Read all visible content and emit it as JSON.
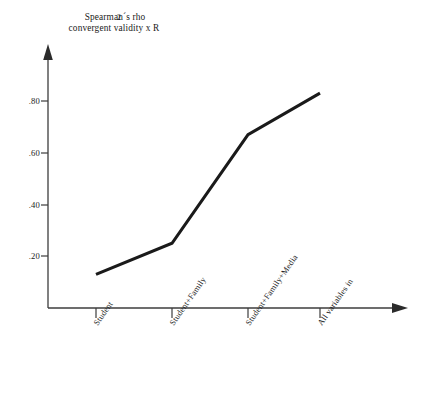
{
  "chart_data": {
    "type": "line",
    "title": "Spearman´s rho convergent validity x R",
    "title_line1": "Spearman´s rho",
    "title_line2": "convergent validity x R",
    "title_superscript": "2",
    "xlabel": "",
    "ylabel": "Spearman´s rho convergent validity x R2",
    "categories": [
      "Student",
      "Student+Family",
      "Student+Family+Media",
      "All variables in"
    ],
    "values": [
      0.13,
      0.25,
      0.67,
      0.83
    ],
    "ytick_labels": [
      ".20",
      ".40",
      ".60",
      ".80"
    ],
    "ytick_values": [
      0.2,
      0.4,
      0.6,
      0.8
    ],
    "ylim": [
      0.0,
      1.0
    ],
    "grid": false,
    "legend": "none",
    "series": [
      {
        "name": "Spearman´s rho convergent validity x R2",
        "values": [
          0.13,
          0.25,
          0.67,
          0.83
        ]
      }
    ],
    "line_color": "#1a1a1a",
    "axis_color": "#3c3c3c",
    "background_color": "#ffffff"
  },
  "axes": {
    "y_axis_name": "vertical-value-axis",
    "x_axis_name": "horizontal-category-axis",
    "y_arrow": "arrow-up",
    "x_arrow": "arrow-right"
  }
}
